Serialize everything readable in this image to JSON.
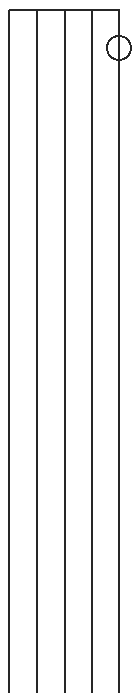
{
  "canvas": {
    "width": 136,
    "height": 693,
    "background_color": "#ffffff",
    "title": "Technical Line Drawing"
  },
  "style": {
    "stroke_color": "#262626",
    "stroke_width": 2,
    "fill": "none"
  },
  "drawing": {
    "type": "line-drawing",
    "description": "Elongated vertical panel divided into four bays by five vertical rules, closed by a single horizontal rule at the top, with a small circle centred on the rightmost vertical rule near the top.",
    "top_edge": {
      "name": "top-horizontal-rule",
      "x1": 9,
      "y1": 10,
      "x2": 120,
      "y2": 10
    },
    "vertical_rules": [
      {
        "label": "rule-1",
        "x": 9,
        "y1": 10,
        "y2": 693
      },
      {
        "label": "rule-2",
        "x": 37,
        "y1": 10,
        "y2": 693
      },
      {
        "label": "rule-3",
        "x": 65,
        "y1": 10,
        "y2": 693
      },
      {
        "label": "rule-4",
        "x": 92,
        "y1": 10,
        "y2": 693
      },
      {
        "label": "rule-5",
        "x": 119,
        "y1": 10,
        "y2": 693
      }
    ],
    "circle_marker": {
      "label": "circle-marker",
      "cx": 119,
      "cy": 48,
      "r": 12
    }
  }
}
